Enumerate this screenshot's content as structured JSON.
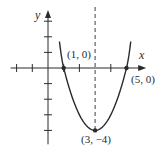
{
  "chart_data": {
    "type": "line",
    "title": "",
    "xlabel": "x",
    "ylabel": "y",
    "function": "y = (x - 3)^2 - 4",
    "xlim": [
      -2,
      6
    ],
    "ylim": [
      -4.7,
      3.7
    ],
    "x_ticks": [
      -2,
      -1,
      1,
      2,
      4
    ],
    "y_ticks": [
      3,
      2,
      1,
      -1,
      -2,
      -3,
      -4
    ],
    "tick_labels_shown": false,
    "grid": false,
    "axis_of_symmetry": {
      "x": 3,
      "style": "dashed"
    },
    "series": [
      {
        "name": "parabola",
        "x": [
          0.9,
          1,
          1.5,
          2,
          2.5,
          3,
          3.5,
          4,
          4.5,
          5,
          5.1
        ],
        "y": [
          0.41,
          0,
          -1.75,
          -3,
          -3.75,
          -4,
          -3.75,
          -3,
          -1.75,
          0,
          0.41
        ]
      }
    ],
    "points": [
      {
        "x": 1,
        "y": 0,
        "label": "(1, 0)"
      },
      {
        "x": 5,
        "y": 0,
        "label": "(5, 0)"
      },
      {
        "x": 3,
        "y": -4,
        "label": "(3, −4)"
      }
    ],
    "colors": {
      "ink": "#2a2a2a",
      "background": "#ffffff"
    }
  }
}
